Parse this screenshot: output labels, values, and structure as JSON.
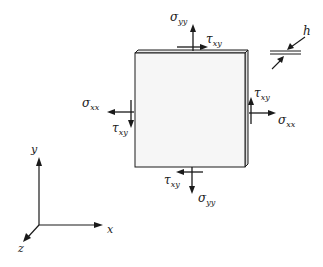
{
  "diagram": {
    "type": "plane stress element",
    "colors": {
      "stroke": "#1a1a1a",
      "plate_face": "#f6f6f6",
      "plate_edge": "#e4e4e4",
      "background": "#ffffff"
    },
    "plate": {
      "front": {
        "x": 135,
        "y": 53,
        "width": 110,
        "height": 114
      },
      "thickness_offset": {
        "dx": 3,
        "dy": -3
      }
    },
    "labels": {
      "top_sigma": {
        "base": "σ",
        "sub": "yy"
      },
      "top_tau": {
        "base": "τ",
        "sub": "xy"
      },
      "left_sigma": {
        "base": "σ",
        "sub": "xx"
      },
      "left_tau": {
        "base": "τ",
        "sub": "xy"
      },
      "right_sigma": {
        "base": "σ",
        "sub": "xx"
      },
      "right_tau": {
        "base": "τ",
        "sub": "xy"
      },
      "bottom_sigma": {
        "base": "σ",
        "sub": "yy"
      },
      "bottom_tau": {
        "base": "τ",
        "sub": "xy"
      },
      "thickness": "h"
    },
    "axes": {
      "origin": {
        "x": 39,
        "y": 225
      },
      "x_label": "x",
      "y_label": "y",
      "z_label": "z"
    }
  }
}
